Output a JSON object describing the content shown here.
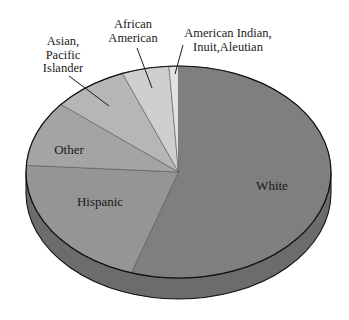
{
  "chart_data": {
    "type": "pie",
    "style": "3d",
    "title": "",
    "start_angle_deg": 0,
    "direction": "clockwise",
    "categories": [
      "White",
      "Hispanic",
      "Other",
      "Asian, Pacific Islander",
      "African American",
      "American Indian, Inuit, Aleutian"
    ],
    "values": [
      55,
      21,
      10,
      8,
      5,
      1
    ],
    "unit": "percent (estimated from slice angles)",
    "colors": [
      "#7f7f7f",
      "#959595",
      "#a4a4a4",
      "#b6b6b6",
      "#cfcfcf",
      "#e2e2e2"
    ],
    "side_color": "#6c6c6c",
    "legend": "none (direct labels)",
    "labels": [
      {
        "category": "White",
        "lines": [
          "White"
        ],
        "placement": "inside"
      },
      {
        "category": "Hispanic",
        "lines": [
          "Hispanic"
        ],
        "placement": "inside"
      },
      {
        "category": "Other",
        "lines": [
          "Other"
        ],
        "placement": "inside"
      },
      {
        "category": "Asian, Pacific Islander",
        "lines": [
          "Asian,",
          "Pacific",
          "Islander"
        ],
        "placement": "outside-leader"
      },
      {
        "category": "African American",
        "lines": [
          "African",
          "American"
        ],
        "placement": "outside-leader"
      },
      {
        "category": "American Indian, Inuit, Aleutian",
        "lines": [
          "American Indian,",
          "Inuit,Aleutian"
        ],
        "placement": "outside-leader"
      }
    ]
  }
}
